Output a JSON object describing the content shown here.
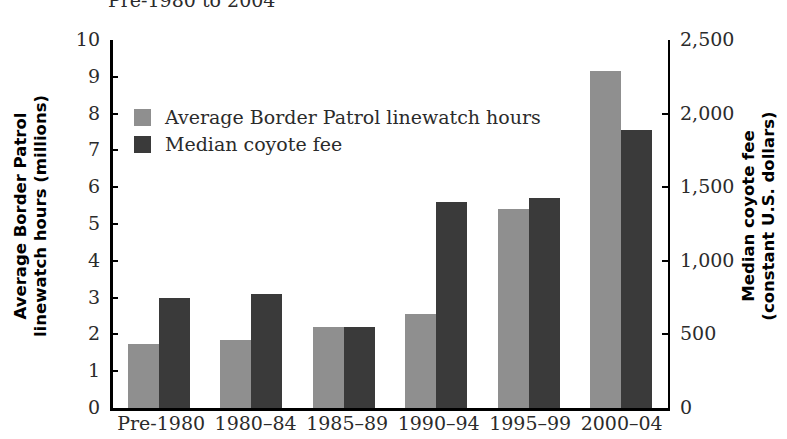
{
  "chart_data": {
    "type": "bar",
    "title": "Pre-1980 to 2004",
    "categories": [
      "Pre-1980",
      "1980–84",
      "1985–89",
      "1990–94",
      "1995–99",
      "2000–04"
    ],
    "series": [
      {
        "name": "Average Border Patrol linewatch hours",
        "axis": "left",
        "color": "#8f8f8f",
        "values": [
          1.75,
          1.85,
          2.2,
          2.55,
          5.4,
          9.15
        ]
      },
      {
        "name": "Median coyote fee",
        "axis": "right",
        "color": "#3a3a3a",
        "values": [
          750,
          775,
          550,
          1400,
          1425,
          1888
        ]
      }
    ],
    "xlabel": "",
    "ylabel": "Average Border Patrol linewatch hours (millions)",
    "y2label": "Median coyote fee (constant U.S. dollars)",
    "ylim": [
      0,
      10
    ],
    "y2lim": [
      0,
      2500
    ],
    "yticks": [
      0,
      1,
      2,
      3,
      4,
      5,
      6,
      7,
      8,
      9,
      10
    ],
    "ytick_labels": [
      "0",
      "1",
      "2",
      "3",
      "4",
      "5",
      "6",
      "7",
      "8",
      "9",
      "10"
    ],
    "y2ticks": [
      0,
      500,
      1000,
      1500,
      2000,
      2500
    ],
    "y2tick_labels": [
      "0",
      "500",
      "1,000",
      "1,500",
      "2,000",
      "2,500"
    ],
    "grid": false,
    "legend_position": "upper-left-inside"
  },
  "axis_titles": {
    "left_line1": "Average Border Patrol",
    "left_line2": "linewatch hours (millions)",
    "right_line1": "Median coyote fee",
    "right_line2": "(constant U.S. dollars)"
  },
  "legend": {
    "items": [
      {
        "label": "Average Border Patrol linewatch hours",
        "swatch": "gray-swatch"
      },
      {
        "label": "Median coyote fee",
        "swatch": "dark-swatch"
      }
    ]
  }
}
